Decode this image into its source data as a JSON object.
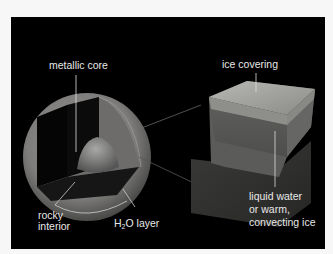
{
  "diagram": {
    "labels": {
      "metallic_core": "metallic core",
      "rocky_interior_1": "rocky",
      "rocky_interior_2": "interior",
      "h2o_prefix": "H",
      "h2o_sub": "2",
      "h2o_suffix": "O layer",
      "ice_covering": "ice covering",
      "liquid_1": "liquid water",
      "liquid_2": "or warm,",
      "liquid_3": "convecting ice"
    },
    "colors": {
      "background": "#000000",
      "label_text": "#e8e8e8",
      "frame": "#f7f7f7"
    }
  }
}
